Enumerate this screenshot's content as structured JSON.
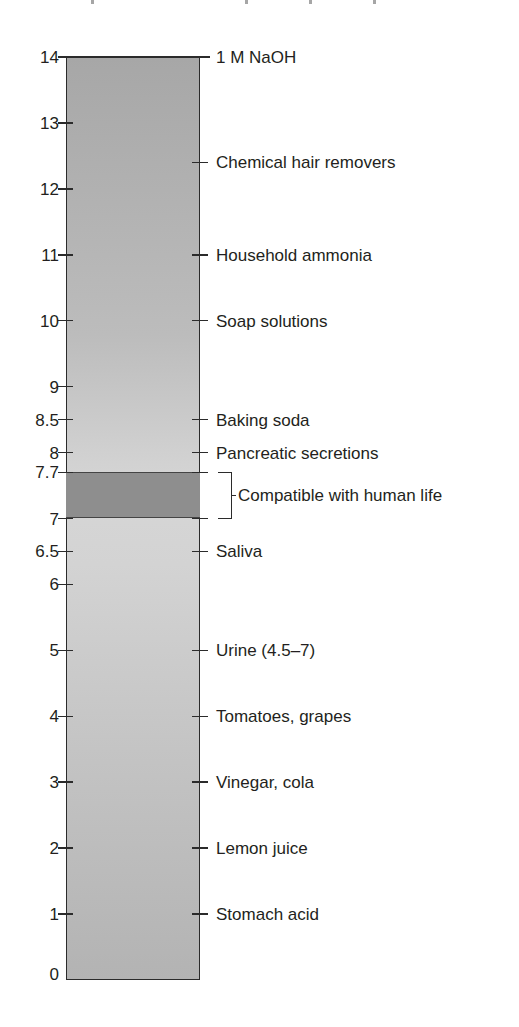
{
  "chart_data": {
    "type": "scale",
    "title": "",
    "axis": {
      "label": "pH",
      "min": 0,
      "max": 14,
      "ticks": [
        0,
        1,
        2,
        3,
        4,
        5,
        6,
        6.5,
        7,
        7.7,
        8,
        8.5,
        9,
        10,
        11,
        12,
        13,
        14
      ],
      "tick_labels": [
        "0",
        "1",
        "2",
        "3",
        "4",
        "5",
        "6",
        "6.5",
        "7",
        "7.7",
        "8",
        "8.5",
        "9",
        "10",
        "11",
        "12",
        "13",
        "14"
      ]
    },
    "highlight_band": {
      "from": 7.0,
      "to": 7.7,
      "label": "Compatible with human life",
      "color": "#8e8e8e"
    },
    "annotations": [
      {
        "ph": 14,
        "label": "1 M NaOH"
      },
      {
        "ph": 12.4,
        "label": "Chemical hair removers"
      },
      {
        "ph": 11,
        "label": "Household ammonia"
      },
      {
        "ph": 10,
        "label": "Soap solutions"
      },
      {
        "ph": 8.5,
        "label": "Baking soda"
      },
      {
        "ph": 8,
        "label": "Pancreatic secretions"
      },
      {
        "ph": 6.5,
        "label": "Saliva"
      },
      {
        "ph": 5,
        "label": "Urine (4.5–7)"
      },
      {
        "ph": 4,
        "label": "Tomatoes, grapes"
      },
      {
        "ph": 3,
        "label": "Vinegar, cola"
      },
      {
        "ph": 2,
        "label": "Lemon juice"
      },
      {
        "ph": 1,
        "label": "Stomach acid"
      }
    ],
    "colors": {
      "bar_top": "#a7a7a7",
      "bar_mid": "#d6d6d6",
      "bar_bottom": "#b3b3b3",
      "band": "#8e8e8e",
      "line": "#2b2b2b"
    }
  },
  "left_labels": [
    "14",
    "13",
    "12",
    "11",
    "10",
    "9",
    "8.5",
    "8",
    "7.7",
    "7",
    "6.5",
    "6",
    "5",
    "4",
    "3",
    "2",
    "1",
    "0"
  ],
  "right_labels": [
    "1 M NaOH",
    "Chemical hair removers",
    "Household ammonia",
    "Soap solutions",
    "Baking soda",
    "Pancreatic secretions",
    "Compatible with human life",
    "Saliva",
    "Urine (4.5–7)",
    "Tomatoes, grapes",
    "Vinegar, cola",
    "Lemon juice",
    "Stomach acid"
  ]
}
